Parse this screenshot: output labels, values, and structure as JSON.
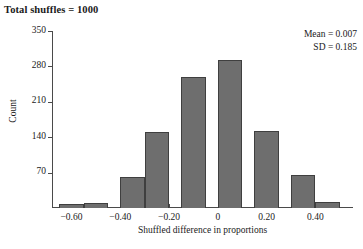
{
  "chart_data": {
    "type": "bar",
    "title": "Total shuffles = 1000",
    "xlabel": "Shuffled difference in proportions",
    "ylabel": "Count",
    "bin_width": 0.1,
    "categories": [
      "-0.60",
      "-0.50",
      "-0.35",
      "-0.25",
      "-0.10",
      "0.05",
      "0.20",
      "0.35",
      "0.45"
    ],
    "x": [
      -0.6,
      -0.5,
      -0.35,
      -0.25,
      -0.1,
      0.05,
      0.2,
      0.35,
      0.45
    ],
    "values": [
      8,
      10,
      62,
      150,
      260,
      292,
      152,
      66,
      12
    ],
    "ylim": [
      0,
      350
    ],
    "xlim": [
      -0.68,
      0.55
    ],
    "yticks": [
      70,
      140,
      210,
      280,
      350
    ],
    "ytick_labels": [
      "70",
      "140",
      "210",
      "280",
      "350"
    ],
    "xticks": [
      -0.6,
      -0.4,
      -0.2,
      0,
      0.2,
      0.4
    ],
    "xtick_labels": [
      "−0.60",
      "−0.40",
      "−0.20",
      "0",
      "0.20",
      "0.40"
    ],
    "grid": false,
    "legend": null,
    "bar_color": "#6e6e6e",
    "bar_edge_color": "#3f3f3f",
    "axis_color": "#4a4a4a",
    "annotations": [
      {
        "label": "Mean = 0.007"
      },
      {
        "label": "SD = 0.185"
      }
    ]
  }
}
